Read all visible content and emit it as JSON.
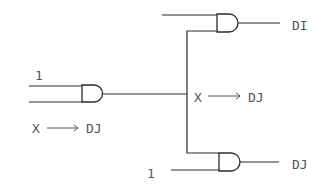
{
  "diagram": {
    "type": "logic-circuit",
    "colors": {
      "line": "#2a2a2a",
      "text": "#555555",
      "background": "#ffffff"
    },
    "gates": [
      {
        "id": "and-left",
        "kind": "AND",
        "inputs": [
          "1",
          "unlabeled"
        ],
        "note": "X → DJ"
      },
      {
        "id": "and-top",
        "kind": "AND",
        "output": "DI"
      },
      {
        "id": "and-bottom",
        "kind": "AND",
        "inputs": [
          "from-branch",
          "1"
        ],
        "output": "DJ"
      }
    ],
    "labels": {
      "left_input_1": "1",
      "left_note_x": "X",
      "left_note_dj": "DJ",
      "mid_note_x": "X",
      "mid_note_dj": "DJ",
      "top_output": "DI",
      "bottom_output": "DJ",
      "bottom_input_1": "1"
    }
  }
}
